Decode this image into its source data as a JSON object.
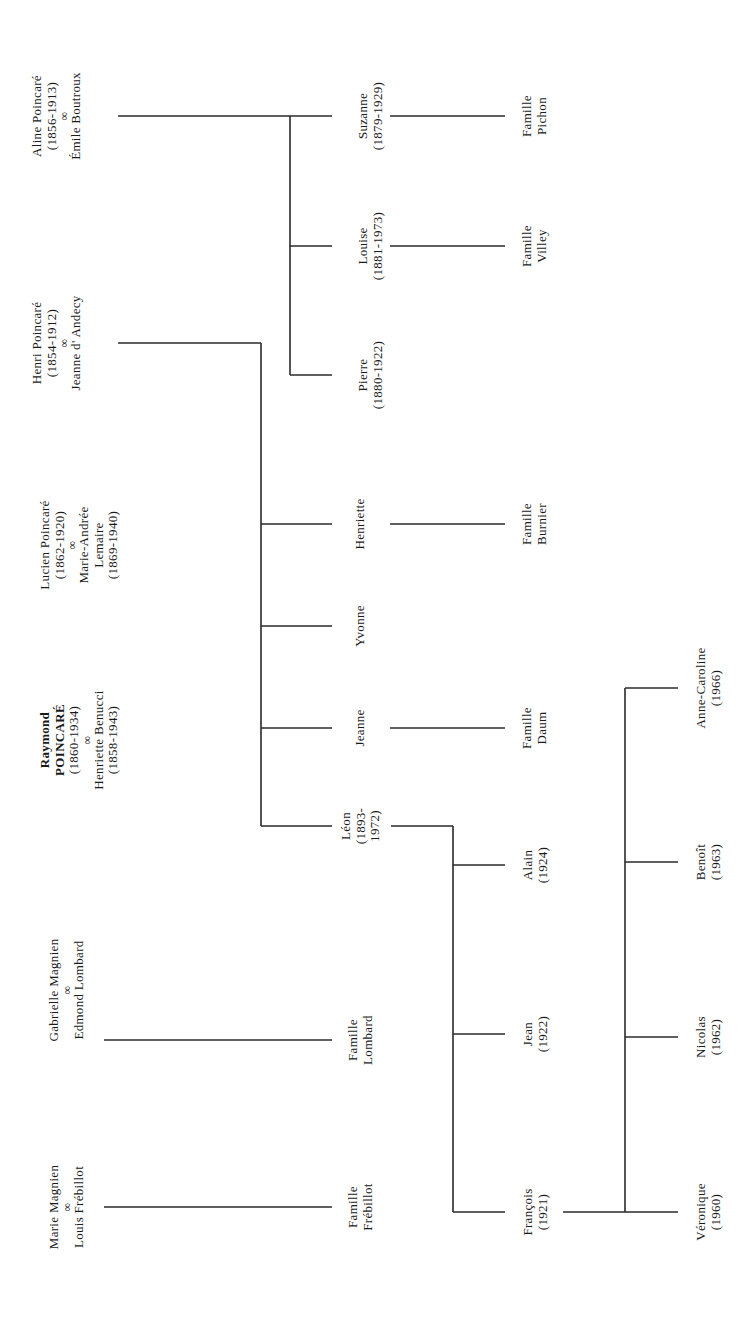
{
  "diagram": {
    "type": "family-tree",
    "orientation": "rotated-90-ccw",
    "line_color": "#2a2a2a",
    "generation_1": [
      {
        "id": "aline",
        "lines": [
          "Aline Poincaré",
          "(1856-1913)",
          "∞",
          "Émile Boutroux"
        ],
        "x": 57,
        "y": 116
      },
      {
        "id": "henri",
        "lines": [
          "Henri Poincaré",
          "(1854-1912)",
          "∞",
          "Jeanne d' Andecy"
        ],
        "x": 57,
        "y": 343
      },
      {
        "id": "lucien",
        "lines": [
          "Lucien Poincaré",
          "(1862-1920)",
          "∞",
          "Marie-Andrée",
          "Lemaire",
          "(1869-1940)"
        ],
        "x": 79,
        "y": 545
      },
      {
        "id": "raymond",
        "lines": [
          "Raymond",
          "POINCARÉ",
          "(1860-1934)",
          "∞",
          "Henriette Benucci",
          "(1858-1943)"
        ],
        "bold_lines": 2,
        "x": 79,
        "y": 740
      },
      {
        "id": "gabrielle",
        "lines": [
          "Gabrielle Magnien",
          "∞",
          "Edmond Lombard"
        ],
        "x": 66,
        "y": 990
      },
      {
        "id": "marie",
        "lines": [
          "Marie Magnien",
          "∞",
          "Louis Frébillot"
        ],
        "x": 66,
        "y": 1207
      }
    ],
    "generation_2": [
      {
        "id": "suzanne",
        "lines": [
          "Suzanne",
          "(1879-1929)"
        ],
        "x": 370,
        "y": 116
      },
      {
        "id": "louise",
        "lines": [
          "Louise",
          "(1881-1973)"
        ],
        "x": 370,
        "y": 246
      },
      {
        "id": "pierre",
        "lines": [
          "Pierre",
          "(1880-1922)"
        ],
        "x": 370,
        "y": 375
      },
      {
        "id": "henriette",
        "lines": [
          "Henriette"
        ],
        "x": 360,
        "y": 524
      },
      {
        "id": "yvonne",
        "lines": [
          "Yvonne"
        ],
        "x": 360,
        "y": 626
      },
      {
        "id": "jeanne",
        "lines": [
          "Jeanne"
        ],
        "x": 360,
        "y": 728
      },
      {
        "id": "leon",
        "lines": [
          "Léon",
          "(1893-",
          "1972)"
        ],
        "x": 361,
        "y": 826
      },
      {
        "id": "famille-lombard",
        "lines": [
          "Famille",
          "Lombard"
        ],
        "x": 360,
        "y": 1040
      },
      {
        "id": "famille-frebillot",
        "lines": [
          "Famille",
          "Frébillot"
        ],
        "x": 360,
        "y": 1207
      }
    ],
    "generation_3": [
      {
        "id": "famille-pichon",
        "lines": [
          "Famille",
          "Pichon"
        ],
        "x": 534,
        "y": 116
      },
      {
        "id": "famille-villey",
        "lines": [
          "Famille",
          "Villey"
        ],
        "x": 534,
        "y": 246
      },
      {
        "id": "famille-burnier",
        "lines": [
          "Famille",
          "Burnier"
        ],
        "x": 534,
        "y": 524
      },
      {
        "id": "famille-daum",
        "lines": [
          "Famille",
          "Daum"
        ],
        "x": 534,
        "y": 728
      },
      {
        "id": "alain",
        "lines": [
          "Alain",
          "(1924)"
        ],
        "x": 535,
        "y": 865
      },
      {
        "id": "jean",
        "lines": [
          "Jean",
          "(1922)"
        ],
        "x": 535,
        "y": 1034
      },
      {
        "id": "francois",
        "lines": [
          "François",
          "(1921)"
        ],
        "x": 535,
        "y": 1212
      }
    ],
    "generation_4": [
      {
        "id": "anne-caroline",
        "lines": [
          "Anne-Caroline",
          "(1966)"
        ],
        "x": 708,
        "y": 688
      },
      {
        "id": "benoit",
        "lines": [
          "Benoît",
          "(1963)"
        ],
        "x": 708,
        "y": 862
      },
      {
        "id": "nicolas",
        "lines": [
          "Nicolas",
          "(1962)"
        ],
        "x": 708,
        "y": 1037
      },
      {
        "id": "veronique",
        "lines": [
          "Véronique",
          "(1960)"
        ],
        "x": 708,
        "y": 1212
      }
    ],
    "connectors": [
      [
        118,
        116,
        332,
        116
      ],
      [
        290,
        116,
        290,
        375
      ],
      [
        290,
        246,
        332,
        246
      ],
      [
        290,
        375,
        332,
        375
      ],
      [
        390,
        116,
        505,
        116
      ],
      [
        390,
        246,
        505,
        246
      ],
      [
        118,
        343,
        261,
        343
      ],
      [
        261,
        343,
        261,
        826
      ],
      [
        261,
        524,
        332,
        524
      ],
      [
        261,
        626,
        332,
        626
      ],
      [
        261,
        728,
        332,
        728
      ],
      [
        261,
        826,
        332,
        826
      ],
      [
        390,
        524,
        505,
        524
      ],
      [
        390,
        728,
        505,
        728
      ],
      [
        104,
        1040,
        332,
        1040
      ],
      [
        104,
        1207,
        332,
        1207
      ],
      [
        391,
        826,
        453,
        826
      ],
      [
        453,
        826,
        453,
        1212
      ],
      [
        453,
        865,
        505,
        865
      ],
      [
        453,
        1034,
        505,
        1034
      ],
      [
        453,
        1212,
        505,
        1212
      ],
      [
        563,
        1212,
        678,
        1212
      ],
      [
        625,
        688,
        625,
        1212
      ],
      [
        625,
        688,
        678,
        688
      ],
      [
        625,
        862,
        678,
        862
      ],
      [
        625,
        1037,
        678,
        1037
      ]
    ]
  }
}
